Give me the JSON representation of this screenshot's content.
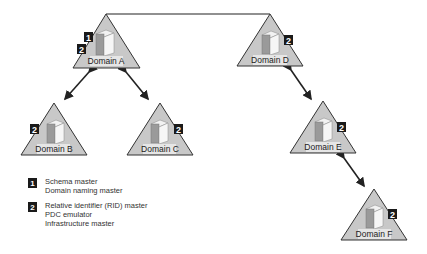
{
  "colors": {
    "triangle_fill": "#c8c8c8",
    "triangle_stroke": "#333333",
    "badge": "#1a1a1a",
    "line": "#222222"
  },
  "domains": [
    {
      "id": "A",
      "label": "Domain A",
      "badges": [
        "1",
        "2"
      ]
    },
    {
      "id": "B",
      "label": "Domain B",
      "badges": [
        "2"
      ]
    },
    {
      "id": "C",
      "label": "Domain C",
      "badges": [
        "2"
      ]
    },
    {
      "id": "D",
      "label": "Domain D",
      "badges": [
        "2"
      ]
    },
    {
      "id": "E",
      "label": "Domain E",
      "badges": [
        "2"
      ]
    },
    {
      "id": "F",
      "label": "Domain F",
      "badges": [
        "2"
      ]
    }
  ],
  "connections": [
    {
      "from": "A",
      "to": "D",
      "type": "line"
    },
    {
      "from": "A",
      "to": "B",
      "type": "two-way-arrow"
    },
    {
      "from": "A",
      "to": "C",
      "type": "two-way-arrow"
    },
    {
      "from": "D",
      "to": "E",
      "type": "two-way-arrow"
    },
    {
      "from": "E",
      "to": "F",
      "type": "two-way-arrow"
    }
  ],
  "legend": [
    {
      "badge": "1",
      "lines": [
        "Schema master",
        "Domain naming master"
      ]
    },
    {
      "badge": "2",
      "lines": [
        "Relative identifier (RID) master",
        "PDC emulator",
        "Infrastructure master"
      ]
    }
  ]
}
